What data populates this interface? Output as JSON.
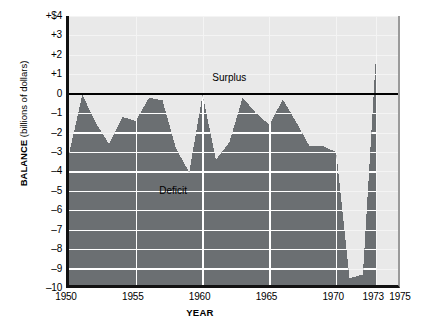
{
  "chart_data": {
    "type": "area",
    "title": "",
    "xlabel": "YEAR",
    "ylabel": "BALANCE (billions of dollars)",
    "ylabel_bold_part": "BALANCE",
    "ylabel_plain_part": " (billions of dollars)",
    "xlim": [
      1950,
      1975
    ],
    "ylim": [
      -10,
      4
    ],
    "grid": true,
    "grid_step": 1,
    "zero_line": 0,
    "y_ticks": [
      {
        "value": 4,
        "label": "+$4"
      },
      {
        "value": 3,
        "label": "+3"
      },
      {
        "value": 2,
        "label": "+2"
      },
      {
        "value": 1,
        "label": "+1"
      },
      {
        "value": 0,
        "label": "0"
      },
      {
        "value": -1,
        "label": "–1"
      },
      {
        "value": -2,
        "label": "–2"
      },
      {
        "value": -3,
        "label": "–3"
      },
      {
        "value": -4,
        "label": "–4"
      },
      {
        "value": -5,
        "label": "–5"
      },
      {
        "value": -6,
        "label": "–6"
      },
      {
        "value": -7,
        "label": "–7"
      },
      {
        "value": -8,
        "label": "–8"
      },
      {
        "value": -9,
        "label": "–9"
      },
      {
        "value": -10,
        "label": "–10"
      }
    ],
    "x_ticks": [
      {
        "value": 1950,
        "label": "1950"
      },
      {
        "value": 1955,
        "label": "1955"
      },
      {
        "value": 1960,
        "label": "1960"
      },
      {
        "value": 1965,
        "label": "1965"
      },
      {
        "value": 1970,
        "label": "1970"
      },
      {
        "value": 1973,
        "label": "1973"
      },
      {
        "value": 1975,
        "label": "1975"
      }
    ],
    "series": [
      {
        "name": "Federal budget balance",
        "fill_color": "#6b6f72",
        "x": [
          1950,
          1951,
          1952,
          1953,
          1954,
          1955,
          1956,
          1957,
          1958,
          1959,
          1960,
          1961,
          1962,
          1963,
          1964,
          1965,
          1966,
          1967,
          1968,
          1969,
          1970,
          1971,
          1972,
          1973
        ],
        "values": [
          -3.1,
          -0.05,
          -1.5,
          -2.6,
          -1.2,
          -1.4,
          -0.2,
          -0.35,
          -2.8,
          -4.05,
          -0.05,
          -3.4,
          -2.5,
          -0.2,
          -1.0,
          -1.6,
          -0.3,
          -1.45,
          -2.7,
          -2.7,
          -3.0,
          -9.5,
          -9.3,
          2.2
        ]
      }
    ],
    "annotations": [
      {
        "text": "Surplus",
        "x": 1962.0,
        "y": 0.75
      },
      {
        "text": "Deficit",
        "x": 1957.8,
        "y": -5.05
      }
    ],
    "colors": {
      "plot_background": "#e9e9e9",
      "area_fill": "#6b6f72",
      "gridline_on_fill": "#ffffff",
      "gridline_on_background": "#f4f4f4",
      "axis": "#111111",
      "zero_line": "#000000",
      "text": "#000000"
    }
  }
}
